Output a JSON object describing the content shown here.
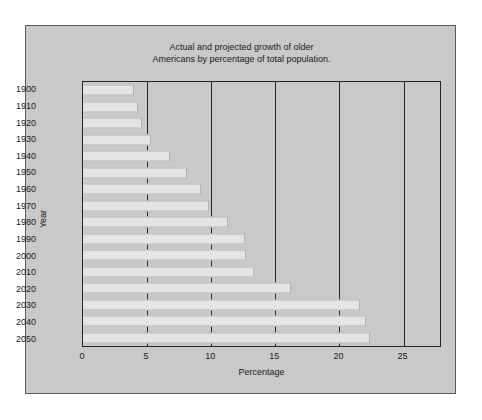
{
  "chart_data": {
    "type": "bar",
    "orientation": "horizontal",
    "title": "Actual and projected growth of older Americans by percentage of total population.",
    "title_lines": [
      "Actual and projected growth of older",
      "Americans by percentage of total population."
    ],
    "xlabel": "Percentage",
    "ylabel": "Year",
    "categories": [
      "1900",
      "1910",
      "1920",
      "1930",
      "1940",
      "1950",
      "1960",
      "1970",
      "1980",
      "1990",
      "2000",
      "2010",
      "2020",
      "2030",
      "2040",
      "2050"
    ],
    "values": [
      4.0,
      4.3,
      4.6,
      5.3,
      6.8,
      8.1,
      9.2,
      9.8,
      11.3,
      12.6,
      12.7,
      13.3,
      16.2,
      21.6,
      22.1,
      22.4
    ],
    "xlim": [
      0,
      28
    ],
    "ylim_categories": 16,
    "xticks": [
      0,
      5,
      10,
      15,
      20,
      25
    ],
    "xtick_labels": [
      "0",
      "5",
      "10",
      "15",
      "20",
      "25"
    ],
    "gridlines": [
      5,
      10,
      15,
      20,
      25
    ],
    "grid": true,
    "legend": null,
    "colors": {
      "figure_background": "#c9c9c9",
      "plot_background": "#c9c9c9",
      "bar_fill": "#e4e4e4",
      "bar_edge": "#b4b4b4",
      "axis": "#262626",
      "text": "#1a1a1a",
      "page_background": "#ffffff"
    }
  }
}
